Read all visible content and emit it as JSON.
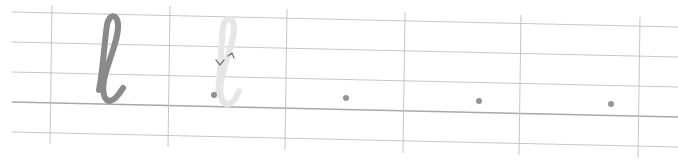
{
  "worksheet": {
    "letter": "l",
    "colors": {
      "grid_line": "#c4c4c4",
      "baseline": "#a9a9a9",
      "model_letter": "#8a8a8a",
      "trace_letter": "#e6e6e6",
      "start_dot": "#8f8f8f",
      "arrow": "#7a7a7a"
    },
    "cells": [
      {
        "type": "model",
        "content": "l"
      },
      {
        "type": "trace",
        "content": "l",
        "has_direction_arrow": true,
        "has_start_dot": true
      },
      {
        "type": "practice",
        "has_start_dot": true
      },
      {
        "type": "practice",
        "has_start_dot": true
      },
      {
        "type": "practice",
        "has_start_dot": true
      }
    ]
  }
}
